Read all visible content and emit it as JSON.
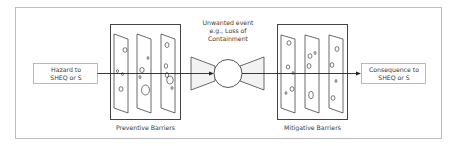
{
  "diagram": {
    "type": "bow-tie",
    "hazard": {
      "line1": "Hazard to",
      "line2": "SHEQ or S"
    },
    "top_event": {
      "line1": "Unwanted event",
      "line2": "e.g., Loss of",
      "line3": "Containment"
    },
    "consequence": {
      "line1": "Consequence to",
      "line2": "SHEQ or S"
    },
    "preventive_barriers": {
      "label": "Preventive Barriers",
      "count": 3
    },
    "mitigative_barriers": {
      "label": "Mitigative Barriers",
      "count": 3
    },
    "colors": {
      "line": "#333333",
      "frame": "#bdbdbd",
      "box_border": "#aaaaaa",
      "fill": "#f2f2f2"
    }
  }
}
